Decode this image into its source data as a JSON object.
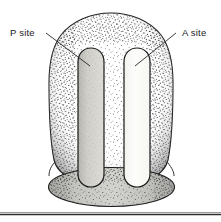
{
  "figure": {
    "name": "ribosome-binding-sites-diagram",
    "background_color": "#ffffff",
    "width": 221,
    "height": 222
  },
  "labels": {
    "p_site": "P site",
    "a_site": "A site"
  },
  "diagram": {
    "large_subunit_name": "large-subunit-body",
    "small_subunit_name": "small-subunit-base",
    "p_site_slot_name": "p-site-slot",
    "a_site_slot_name": "a-site-slot",
    "body_fill": "#c9c9c6",
    "body_stroke": "#1c1c1c",
    "p_slot_fill": "#c4c3bd",
    "a_slot_fill": "#fbfbf9",
    "base_fill": "#c2c2bf",
    "stipple_color": "#2b2b2b"
  },
  "rule": {
    "name": "bottom-horizontal-rule",
    "color": "#3a3a3a"
  }
}
